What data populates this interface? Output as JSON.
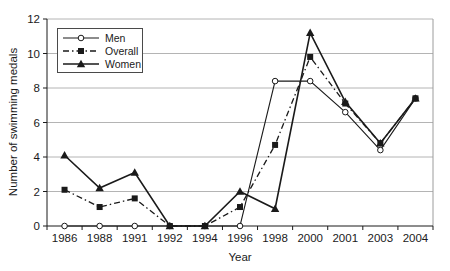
{
  "figure": {
    "background": "#ffffff",
    "axis_color": "#1a1a1a",
    "gridline_color": "#b4b4b4",
    "plot_border_color": "#9c9c9c",
    "text_color": "#1a1a1a"
  },
  "chart_data": {
    "type": "line",
    "title": "",
    "xlabel": "Year",
    "ylabel": "Number of swimming medals",
    "categories": [
      "1986",
      "1988",
      "1991",
      "1992",
      "1994",
      "1996",
      "1998",
      "2000",
      "2001",
      "2003",
      "2004"
    ],
    "ylim": [
      0,
      12
    ],
    "yticks": [
      0,
      2,
      4,
      6,
      8,
      10,
      12
    ],
    "grid": "horizontal-only",
    "legend_position": "top-left-inside",
    "legend_order": [
      "Men",
      "Overall",
      "Women"
    ],
    "series": [
      {
        "name": "Men",
        "marker": "circle-open",
        "line_style": "solid",
        "color": "#1a1a1a",
        "values": [
          0,
          0,
          0,
          0,
          0,
          0,
          8.4,
          8.4,
          6.6,
          4.4,
          7.4
        ]
      },
      {
        "name": "Overall",
        "marker": "square-filled",
        "line_style": "dash-dot",
        "color": "#1a1a1a",
        "values": [
          2.1,
          1.1,
          1.6,
          0,
          0,
          1.1,
          4.7,
          9.8,
          7.1,
          4.8,
          7.4
        ]
      },
      {
        "name": "Women",
        "marker": "triangle-filled",
        "line_style": "solid",
        "color": "#1a1a1a",
        "values": [
          4.1,
          2.2,
          3.1,
          0,
          0,
          2.0,
          1.0,
          11.2,
          7.2,
          4.8,
          7.4
        ]
      }
    ]
  }
}
